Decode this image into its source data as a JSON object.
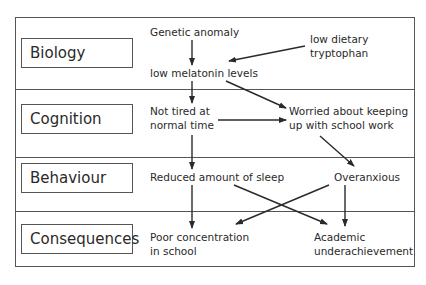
{
  "rows": [
    {
      "label": "Biology"
    },
    {
      "label": "Cognition"
    },
    {
      "label": "Behaviour"
    },
    {
      "label": "Consequences"
    }
  ],
  "nodes": {
    "genetic_anomaly": "Genetic anomaly",
    "low_dietary_tryptophan": "low dietary\ntryptophan",
    "low_melatonin": "low melatonin levels",
    "not_tired": "Not tired at\nnormal time",
    "worried": "Worried about keeping\nup with school work",
    "reduced_sleep": "Reduced amount of sleep",
    "overanxious": "Overanxious",
    "poor_concentration": "Poor concentration\nin school",
    "academic_under": "Academic\nunderachievement"
  },
  "edges": [
    {
      "from": "genetic_anomaly",
      "to": "low_melatonin"
    },
    {
      "from": "low_dietary_tryptophan",
      "to": "low_melatonin"
    },
    {
      "from": "low_melatonin",
      "to": "not_tired"
    },
    {
      "from": "low_melatonin",
      "to": "worried"
    },
    {
      "from": "not_tired",
      "to": "worried"
    },
    {
      "from": "not_tired",
      "to": "reduced_sleep"
    },
    {
      "from": "worried",
      "to": "overanxious"
    },
    {
      "from": "reduced_sleep",
      "to": "poor_concentration"
    },
    {
      "from": "reduced_sleep",
      "to": "academic_under"
    },
    {
      "from": "overanxious",
      "to": "poor_concentration"
    },
    {
      "from": "overanxious",
      "to": "academic_under"
    }
  ],
  "colors": {
    "line": "#2a2a2a",
    "border": "#555555"
  }
}
